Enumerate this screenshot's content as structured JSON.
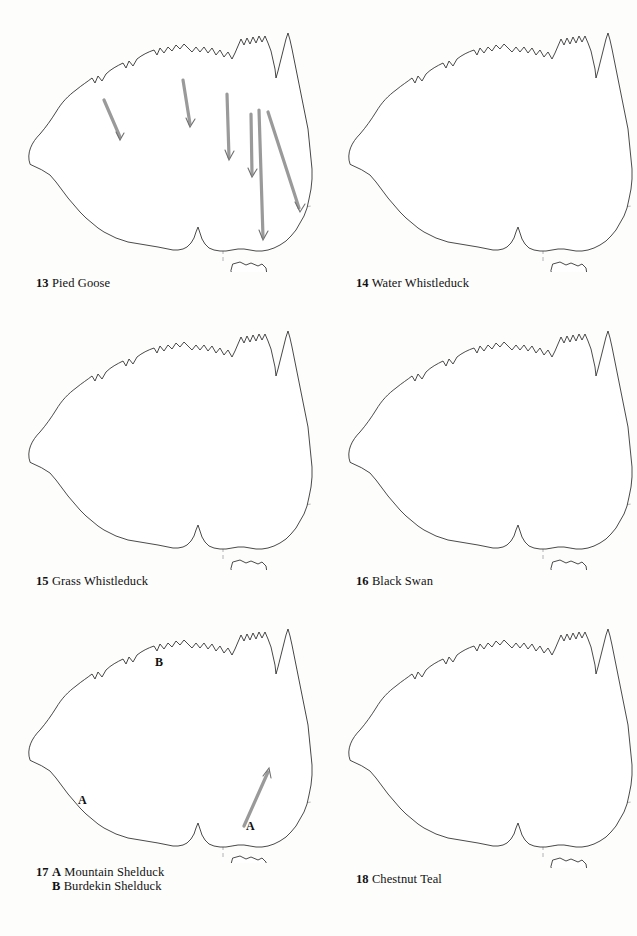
{
  "page": {
    "background": "#fdfdfc",
    "ink": "#111111",
    "layout": "3 rows x 2 columns of Australia distribution maps"
  },
  "panels": [
    {
      "id": "map-13",
      "number": "13",
      "name": "Pied Goose",
      "caption": "13 Pied Goose",
      "shading": "stippled band along the northern (tropical) coast from the Kimberley across Arnhem Land to Cape York and the central Queensland coast",
      "arrows": "six grey arrows sweeping south and south-east from the northern coastal band into the interior and toward south-eastern Australia",
      "labels": [],
      "tasmania": "unshaded"
    },
    {
      "id": "map-14",
      "number": "14",
      "name": "Water Whistleduck",
      "caption": "14 Water Whistleduck",
      "shading": "stippled band across the far north from the Kimberley through Arnhem Land and Cape York, continuing down the entire east Queensland coast to northern New South Wales",
      "arrows": "none",
      "labels": [],
      "tasmania": "unshaded"
    },
    {
      "id": "map-15",
      "number": "15",
      "name": "Grass Whistleduck",
      "caption": "15 Grass Whistleduck",
      "shading": "large stippled region covering the northern half of the Northern Territory, all of Queensland and inland New South Wales eastward",
      "arrows": "none",
      "labels": [],
      "tasmania": "unshaded"
    },
    {
      "id": "map-16",
      "number": "16",
      "name": "Black Swan",
      "caption": "16 Black Swan",
      "shading": "two stippled regions: the south-west of Western Australia, and a large eastern and south-eastern region covering South Australia, Victoria, New South Wales and southern Queensland",
      "arrows": "none",
      "labels": [],
      "tasmania": "shaded"
    },
    {
      "id": "map-17",
      "number": "17",
      "name": "Mountain Shelduck / Burdekin Shelduck",
      "caption_line1": "17 A Mountain Shelduck",
      "caption_line2": "B Burdekin Shelduck",
      "shading": "A = south-west Western Australia and south-eastern Australia including Tasmania; B = the tropical north coast and east Queensland coast",
      "arrows": "one grey arrow pointing north-east from south-eastern Australia into inland New South Wales",
      "labels": [
        {
          "text": "A",
          "where": "south-west Western Australia"
        },
        {
          "text": "A",
          "where": "south-eastern Australia / western Victoria"
        },
        {
          "text": "B",
          "where": "Northern Territory / Arnhem Land"
        }
      ],
      "tasmania": "shaded"
    },
    {
      "id": "map-18",
      "number": "18",
      "name": "Chestnut Teal",
      "caption": "18 Chestnut Teal",
      "shading": "stippled coastal band around the south-west of Western Australia, and a broad band along the east coast from central Queensland through New South Wales and Victoria",
      "arrows": "none",
      "labels": [],
      "tasmania": "shaded"
    }
  ]
}
